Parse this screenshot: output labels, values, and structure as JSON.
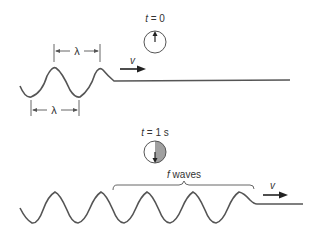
{
  "figure": {
    "top_panel": {
      "clock_label_var": "t",
      "clock_label_rest": " = 0",
      "wavelength_label_top": "λ",
      "wavelength_label_bottom": "λ",
      "velocity_label": "v"
    },
    "bottom_panel": {
      "clock_label_var": "t",
      "clock_label_rest": " = 1 s",
      "brace_label_var": "f",
      "brace_label_rest": " waves",
      "velocity_label": "v"
    },
    "colors": {
      "line": "#555555",
      "clock_fill": "#a0a0a0",
      "background": "#ffffff"
    }
  }
}
